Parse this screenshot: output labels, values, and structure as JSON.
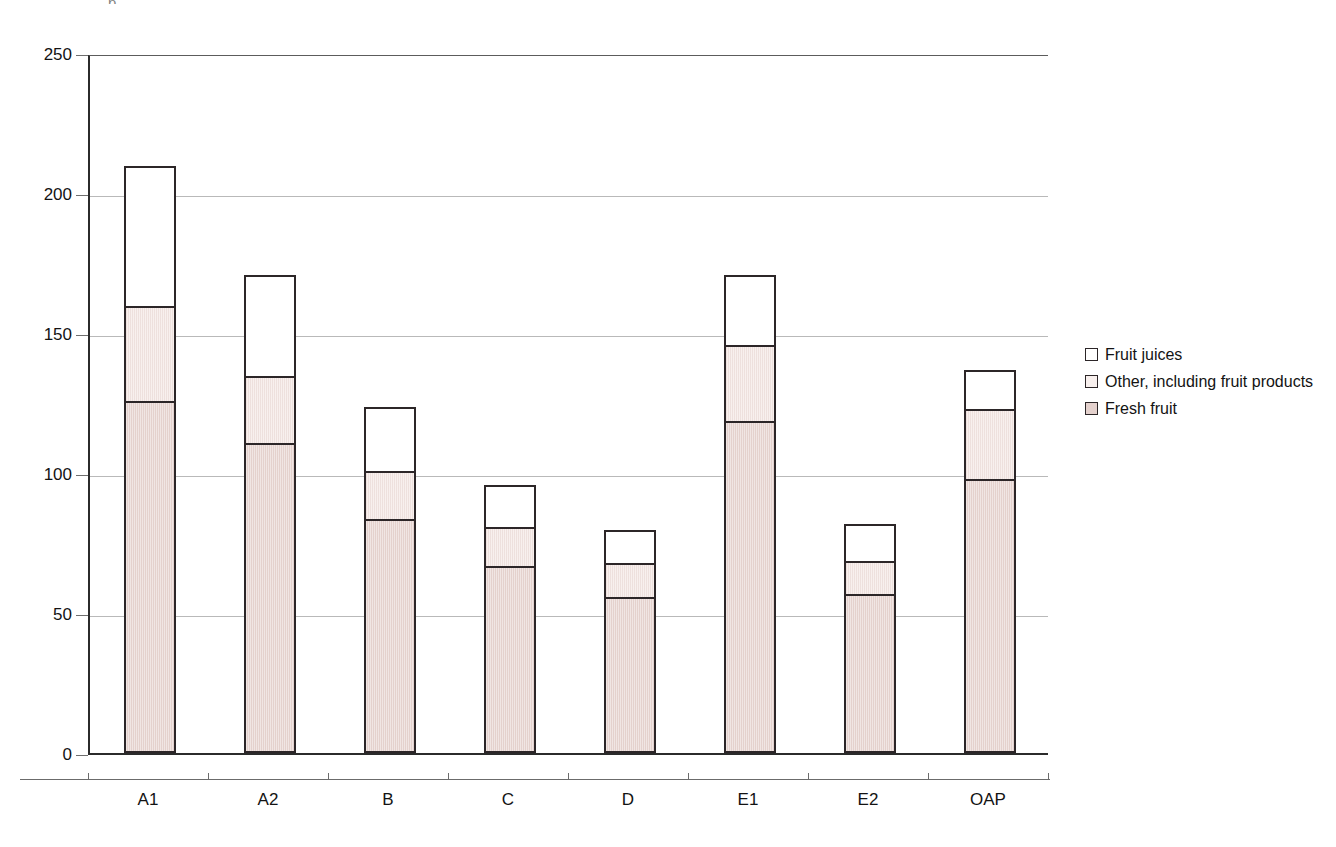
{
  "scan": {
    "top_clipped_text": "p"
  },
  "legend": {
    "position": "right",
    "items": [
      {
        "label": "Fruit juices",
        "swatch": "juice-swatch",
        "color": "#ffffff"
      },
      {
        "label": "Other, including fruit products",
        "swatch": "other-swatch",
        "color": "#f8f0ee"
      },
      {
        "label": "Fresh fruit",
        "swatch": "fresh-swatch",
        "color": "#e4d1cd"
      }
    ]
  },
  "axes": {
    "y_ticks": [
      "0",
      "50",
      "100",
      "150",
      "200",
      "250"
    ],
    "x_ticks": [
      "A1",
      "A2",
      "B",
      "C",
      "D",
      "E1",
      "E2",
      "OAP"
    ]
  },
  "chart_data": {
    "type": "bar",
    "stacked": true,
    "title": "",
    "subtitle": "",
    "xlabel": "",
    "ylabel": "",
    "ylim": [
      0,
      250
    ],
    "ytick_step": 50,
    "grid": true,
    "legend_position": "right",
    "categories": [
      "A1",
      "A2",
      "B",
      "C",
      "D",
      "E1",
      "E2",
      "OAP"
    ],
    "series": [
      {
        "name": "Fresh fruit",
        "color": "#e4d1cd",
        "values": [
          125,
          110,
          83,
          66,
          55,
          118,
          56,
          97
        ]
      },
      {
        "name": "Other, including fruit products",
        "color": "#f8f0ee",
        "values": [
          34,
          24,
          17,
          14,
          12,
          27,
          12,
          25
        ]
      },
      {
        "name": "Fruit juices",
        "color": "#ffffff",
        "values": [
          50,
          36,
          23,
          15,
          12,
          25,
          13,
          14
        ]
      }
    ],
    "cumulative_tops": {
      "Fresh fruit": [
        125,
        110,
        83,
        66,
        55,
        118,
        56,
        97
      ],
      "Other, including fruit products": [
        159,
        134,
        100,
        80,
        67,
        145,
        68,
        122
      ],
      "Total": [
        209,
        170,
        123,
        95,
        79,
        170,
        81,
        136
      ]
    }
  }
}
